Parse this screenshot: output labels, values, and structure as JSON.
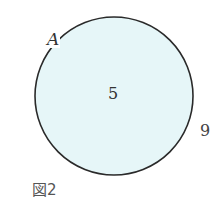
{
  "figure": {
    "caption": "図2",
    "set": {
      "label": "A",
      "inside_count": "5",
      "fill_color": "#e6f6f8",
      "stroke_color": "#2a2a2a"
    },
    "outside_count": "9"
  }
}
